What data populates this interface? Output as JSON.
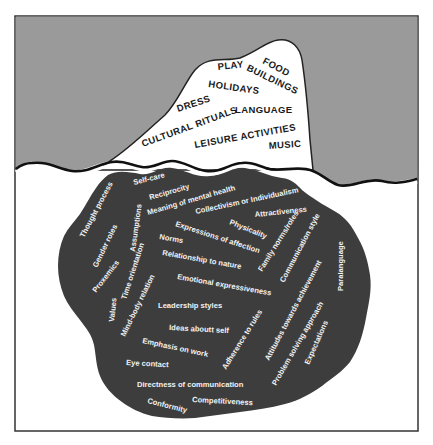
{
  "diagram": {
    "colors": {
      "sky": "#9a9a9a",
      "water": "#ffffff",
      "iceberg_tip": "#ffffff",
      "iceberg_submerged": "#3d3d3d",
      "frame": "#333333",
      "text_above": "#1a1a1a",
      "text_below": "#f2f2f2"
    },
    "above_water": [
      {
        "label": "FOOD"
      },
      {
        "label": "PLAY"
      },
      {
        "label": "BUILDINGS"
      },
      {
        "label": "HOLIDAYS"
      },
      {
        "label": "DRESS"
      },
      {
        "label": "LANGUAGE"
      },
      {
        "label": "CULTURAL RITUALS"
      },
      {
        "label": "LEISURE ACTIVITIES"
      },
      {
        "label": "MUSIC"
      }
    ],
    "below_water": [
      {
        "label": "Self-care"
      },
      {
        "label": "Reciprocity"
      },
      {
        "label": "Meaning of mental health"
      },
      {
        "label": "Collectivism or Individualism"
      },
      {
        "label": "Attractiveness"
      },
      {
        "label": "Thought process"
      },
      {
        "label": "Assumptions"
      },
      {
        "label": "Gender roles"
      },
      {
        "label": "Physicality"
      },
      {
        "label": "Expressions of affection"
      },
      {
        "label": "Norms"
      },
      {
        "label": "Relationship to nature"
      },
      {
        "label": "Proxemics"
      },
      {
        "label": "Time orientation"
      },
      {
        "label": "Family norms/roles"
      },
      {
        "label": "Communication style"
      },
      {
        "label": "Paralanguage"
      },
      {
        "label": "Values"
      },
      {
        "label": "Mind-body relation"
      },
      {
        "label": "Emotional expressiveness"
      },
      {
        "label": "Leadership styles"
      },
      {
        "label": "Attitudes towards achievement"
      },
      {
        "label": "Ideas aboutt self"
      },
      {
        "label": "Adherence to rules"
      },
      {
        "label": "Problem solving approach"
      },
      {
        "label": "Expectations"
      },
      {
        "label": "Emphasis on work"
      },
      {
        "label": "Eye contact"
      },
      {
        "label": "Directness of communication"
      },
      {
        "label": "Competitiveness"
      },
      {
        "label": "Conformity"
      }
    ]
  }
}
